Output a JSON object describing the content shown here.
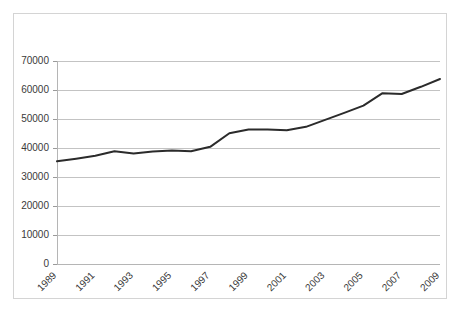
{
  "chart_data": {
    "type": "line",
    "title": "",
    "subtitle": "",
    "xlabel": "",
    "ylabel": "",
    "xlim": [
      1989,
      2009
    ],
    "ylim": [
      0,
      70000
    ],
    "grid": "horizontal",
    "legend": "none",
    "background_color": "#ffffff",
    "gridline_color": "#c3c3c3",
    "line_color": "#2b2b2b",
    "frame_color": "#d4d4d4",
    "x": [
      1989,
      1990,
      1991,
      1992,
      1993,
      1994,
      1995,
      1996,
      1997,
      1998,
      1999,
      2000,
      2001,
      2002,
      2003,
      2004,
      2005,
      2006,
      2007,
      2008,
      2009
    ],
    "values": [
      35400,
      36300,
      37300,
      38900,
      38100,
      38800,
      39100,
      38900,
      40400,
      45100,
      46400,
      46400,
      46100,
      47300,
      49700,
      52100,
      54600,
      58900,
      58600,
      61100,
      63800
    ],
    "series": [
      {
        "name": "series-1",
        "values": [
          35400,
          36300,
          37300,
          38900,
          38100,
          38800,
          39100,
          38900,
          40400,
          45100,
          46400,
          46400,
          46100,
          47300,
          49700,
          52100,
          54600,
          58900,
          58600,
          61100,
          63800
        ]
      }
    ],
    "y_axis": {
      "min": 0,
      "max": 70000,
      "step": 10000,
      "tick_labels": [
        "0",
        "10000",
        "20000",
        "30000",
        "40000",
        "50000",
        "60000",
        "70000"
      ],
      "tick_values": [
        0,
        10000,
        20000,
        30000,
        40000,
        50000,
        60000,
        70000
      ]
    },
    "x_axis": {
      "min": 1989,
      "max": 2009,
      "step": 2,
      "tick_labels": [
        "1989",
        "1991",
        "1993",
        "1995",
        "1997",
        "1999",
        "2001",
        "2003",
        "2005",
        "2007",
        "2009"
      ],
      "tick_values": [
        1989,
        1991,
        1993,
        1995,
        1997,
        1999,
        2001,
        2003,
        2005,
        2007,
        2009
      ],
      "label_rotation_deg": -45
    }
  }
}
